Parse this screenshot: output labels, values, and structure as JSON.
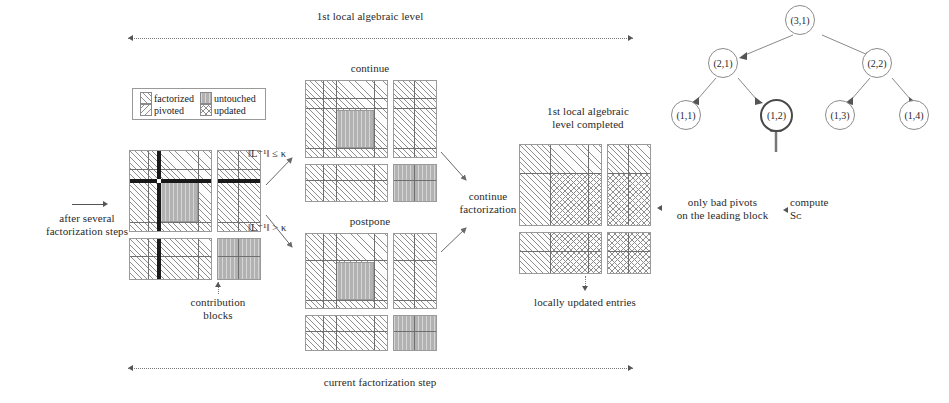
{
  "figure": {
    "top_label": "1st local algebraic level",
    "bottom_label": "current factorization step"
  },
  "legend": {
    "items": [
      {
        "key": "factorized",
        "label": "factorized",
        "pattern": "diagonal-hatch-right"
      },
      {
        "key": "untouched",
        "label": "untouched",
        "pattern": "solid-gray"
      },
      {
        "key": "pivoted",
        "label": "pivoted",
        "pattern": "diagonal-hatch-left"
      },
      {
        "key": "updated",
        "label": "updated",
        "pattern": "cross-hatch"
      }
    ]
  },
  "left_stage": {
    "caption": "after several\nfactorization steps",
    "contribution_label": "contribution\nblocks"
  },
  "branches": {
    "continue": {
      "title": "continue",
      "condition": "‖L⁻¹‖ ≤ κ"
    },
    "postpone": {
      "title": "postpone",
      "condition": "‖L⁻¹‖ > κ"
    },
    "merge_label": "continue\nfactorization"
  },
  "right_stage": {
    "title": "1st local algebraic\nlevel completed",
    "bottom_label": "locally updated entries",
    "right_label_1": "only bad pivots\non the leading block",
    "right_label_2": "compute\nSᴄ"
  },
  "right_stage_math": {
    "compute_symbol": "S",
    "compute_subscript": "c"
  },
  "tree": {
    "nodes": [
      {
        "id": "n31",
        "label": "(3,1)",
        "x": 800,
        "y": 20,
        "r": 15,
        "highlight": false
      },
      {
        "id": "n21",
        "label": "(2,1)",
        "x": 723,
        "y": 60,
        "r": 15,
        "highlight": false
      },
      {
        "id": "n22",
        "label": "(2,2)",
        "x": 877,
        "y": 60,
        "r": 15,
        "highlight": false
      },
      {
        "id": "n11",
        "label": "(1,1)",
        "x": 686,
        "y": 108,
        "r": 15,
        "highlight": false
      },
      {
        "id": "n12",
        "label": "(1,2)",
        "x": 760,
        "y": 108,
        "r": 16,
        "highlight": true
      },
      {
        "id": "n13",
        "label": "(1,3)",
        "x": 840,
        "y": 108,
        "r": 15,
        "highlight": false
      },
      {
        "id": "n14",
        "label": "(1,4)",
        "x": 914,
        "y": 108,
        "r": 15,
        "highlight": false
      }
    ],
    "edges": [
      {
        "from": "n31",
        "to": "n21"
      },
      {
        "from": "n31",
        "to": "n22"
      },
      {
        "from": "n21",
        "to": "n11"
      },
      {
        "from": "n21",
        "to": "n12"
      },
      {
        "from": "n22",
        "to": "n13"
      },
      {
        "from": "n22",
        "to": "n14"
      }
    ],
    "pointer_target": "n12"
  },
  "colors": {
    "hatch": "#8e8e8e",
    "untouched_fill": "#b2b2b2",
    "grid": "#6f6f6f",
    "fat_line": "#191919",
    "node_stroke": "#8c8c8c",
    "highlight_stroke": "#4a4a4a",
    "connector": "#7a7a7a",
    "text": "#2a2a2a"
  }
}
